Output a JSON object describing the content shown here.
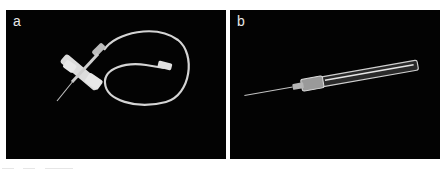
{
  "figure": {
    "panels": [
      {
        "label": "a",
        "subject": "butterfly-needle",
        "background_color": "#030303",
        "object_color": "#d9d9d9"
      },
      {
        "label": "b",
        "subject": "iv-cannula",
        "background_color": "#030303",
        "object_color": "#cfcfcf"
      }
    ]
  }
}
